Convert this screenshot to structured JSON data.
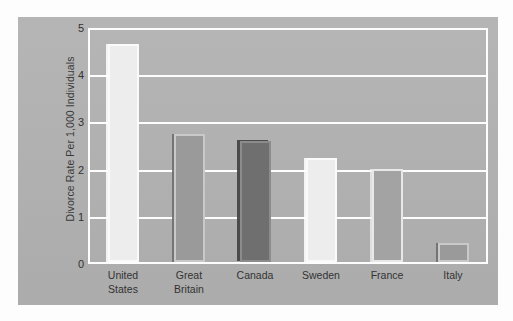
{
  "chart_data": {
    "type": "bar",
    "title": "",
    "xlabel": "",
    "ylabel": "Divorce Rate Per 1,000 Individuals",
    "categories": [
      "United States",
      "Great Britain",
      "Canada",
      "Sweden",
      "France",
      "Italy"
    ],
    "category_lines": [
      [
        "United",
        "States"
      ],
      [
        "Great",
        "Britain"
      ],
      [
        "Canada"
      ],
      [
        "Sweden"
      ],
      [
        "France"
      ],
      [
        "Italy"
      ]
    ],
    "values": [
      4.7,
      2.75,
      2.6,
      2.25,
      2.0,
      0.4
    ],
    "ylim": [
      0,
      5
    ],
    "yticks": [
      "5",
      "4",
      "3",
      "2",
      "1",
      "0"
    ],
    "ytick_values": [
      5,
      4,
      3,
      2,
      1,
      0
    ],
    "grid": true,
    "grid_color": "#fdfdfd",
    "legend": "none",
    "panel_color": "#b2b2b2",
    "bar_colors": [
      "#ededed",
      "#9a9a9a",
      "#6f6f6f",
      "#ededed",
      "#a3a3a3",
      "#9a9a9a"
    ],
    "bar_styles": [
      "bar-light",
      "bar-mid",
      "bar-dark",
      "bar-light",
      "bar-midlight",
      "bar-mid"
    ]
  }
}
